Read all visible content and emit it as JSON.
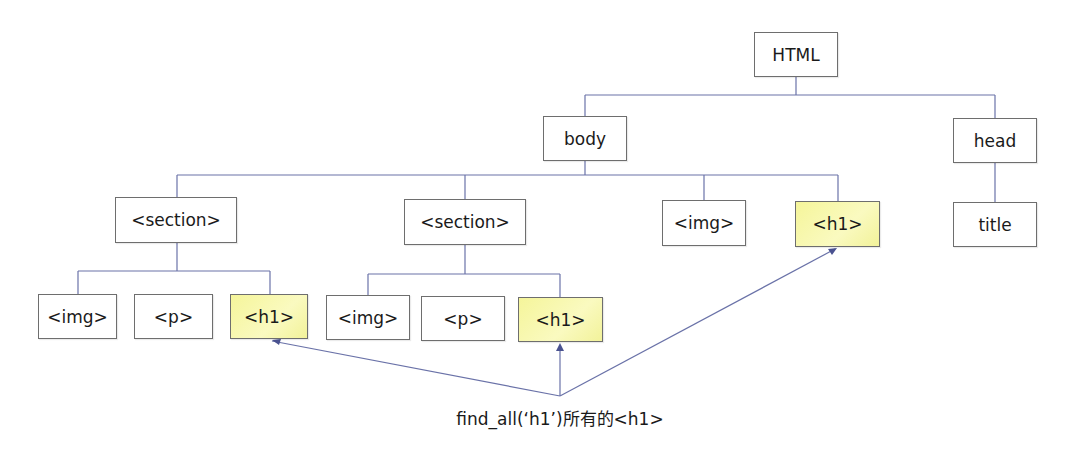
{
  "diagram": {
    "type": "tree",
    "colors": {
      "line": "#6a72a8",
      "highlight": "#f5f59a",
      "border": "#6e6e6e"
    },
    "nodes": {
      "html": {
        "label": "HTML"
      },
      "body": {
        "label": "body"
      },
      "head": {
        "label": "head"
      },
      "title": {
        "label": "title"
      },
      "section1": {
        "label": "<section>"
      },
      "section2": {
        "label": "<section>"
      },
      "img_body": {
        "label": "<img>"
      },
      "h1_body": {
        "label": "<h1>",
        "highlighted": true
      },
      "img_s1": {
        "label": "<img>"
      },
      "p_s1": {
        "label": "<p>"
      },
      "h1_s1": {
        "label": "<h1>",
        "highlighted": true
      },
      "img_s2": {
        "label": "<img>"
      },
      "p_s2": {
        "label": "<p>"
      },
      "h1_s2": {
        "label": "<h1>",
        "highlighted": true
      }
    },
    "edges": [
      [
        "html",
        "body"
      ],
      [
        "html",
        "head"
      ],
      [
        "head",
        "title"
      ],
      [
        "body",
        "section1"
      ],
      [
        "body",
        "section2"
      ],
      [
        "body",
        "img_body"
      ],
      [
        "body",
        "h1_body"
      ],
      [
        "section1",
        "img_s1"
      ],
      [
        "section1",
        "p_s1"
      ],
      [
        "section1",
        "h1_s1"
      ],
      [
        "section2",
        "img_s2"
      ],
      [
        "section2",
        "p_s2"
      ],
      [
        "section2",
        "h1_s2"
      ]
    ],
    "caption": "find_all(‘h1’)所有的<h1>",
    "arrows_to": [
      "h1_s1",
      "h1_s2",
      "h1_body"
    ]
  }
}
